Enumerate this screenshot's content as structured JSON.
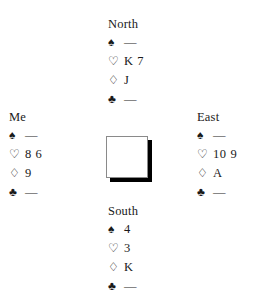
{
  "diagram": {
    "type": "bridge-hand-diagram",
    "background_color": "#ffffff",
    "text_color": "#1a1a1a",
    "suit_symbols": {
      "spade": "♠",
      "heart": "♡",
      "diamond": "♢",
      "club": "♣"
    },
    "void_marker": "—",
    "center_card": {
      "name": "face-down-card",
      "face_color": "#ffffff",
      "border_color": "#8a8a8a",
      "shadow_color": "#000000"
    },
    "hands": {
      "north": {
        "label": "North",
        "suits": [
          {
            "symbol": "♠",
            "name": "spade",
            "cards": "—"
          },
          {
            "symbol": "♡",
            "name": "heart",
            "cards": "K 7"
          },
          {
            "symbol": "♢",
            "name": "diamond",
            "cards": "J"
          },
          {
            "symbol": "♣",
            "name": "club",
            "cards": "—"
          }
        ]
      },
      "west": {
        "label": "Me",
        "suits": [
          {
            "symbol": "♠",
            "name": "spade",
            "cards": "—"
          },
          {
            "symbol": "♡",
            "name": "heart",
            "cards": "8 6"
          },
          {
            "symbol": "♢",
            "name": "diamond",
            "cards": "9"
          },
          {
            "symbol": "♣",
            "name": "club",
            "cards": "—"
          }
        ]
      },
      "east": {
        "label": "East",
        "suits": [
          {
            "symbol": "♠",
            "name": "spade",
            "cards": "—"
          },
          {
            "symbol": "♡",
            "name": "heart",
            "cards": "10 9"
          },
          {
            "symbol": "♢",
            "name": "diamond",
            "cards": "A"
          },
          {
            "symbol": "♣",
            "name": "club",
            "cards": "—"
          }
        ]
      },
      "south": {
        "label": "South",
        "suits": [
          {
            "symbol": "♠",
            "name": "spade",
            "cards": "4"
          },
          {
            "symbol": "♡",
            "name": "heart",
            "cards": "3"
          },
          {
            "symbol": "♢",
            "name": "diamond",
            "cards": "K"
          },
          {
            "symbol": "♣",
            "name": "club",
            "cards": "—"
          }
        ]
      }
    }
  }
}
